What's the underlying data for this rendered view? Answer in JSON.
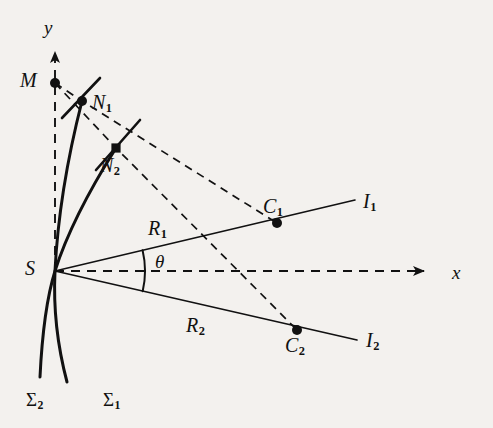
{
  "figure": {
    "kind": "geometric-diagram",
    "background_color": "#f3f1ee",
    "ink_color": "#111111",
    "axes": {
      "x_label": "x",
      "y_label": "y",
      "x_style": "dashed-with-arrow",
      "y_style": "dashed-with-arrow",
      "origin_label": "S"
    },
    "points": [
      {
        "id": "S",
        "label": "S",
        "x": 55,
        "y": 271,
        "marker": "vertex"
      },
      {
        "id": "M",
        "label": "M",
        "x": 55,
        "y": 83,
        "marker": "dot"
      },
      {
        "id": "N1",
        "label": "N",
        "sub": "1",
        "x": 82,
        "y": 101,
        "marker": "dot"
      },
      {
        "id": "N2",
        "label": "N",
        "sub": "2",
        "x": 116,
        "y": 148,
        "marker": "square"
      },
      {
        "id": "C1",
        "label": "C",
        "sub": "1",
        "x": 277,
        "y": 223,
        "marker": "dot"
      },
      {
        "id": "C2",
        "label": "C",
        "sub": "2",
        "x": 297,
        "y": 330,
        "marker": "dot"
      }
    ],
    "labels": [
      {
        "id": "label-y",
        "text": "y",
        "sub": "",
        "x": 44,
        "y": 18
      },
      {
        "id": "label-x",
        "text": "x",
        "sub": "",
        "x": 452,
        "y": 263
      },
      {
        "id": "label-M",
        "text": "M",
        "sub": "",
        "x": 20,
        "y": 70
      },
      {
        "id": "label-N1",
        "text": "N",
        "sub": "1",
        "x": 92,
        "y": 92
      },
      {
        "id": "label-N2",
        "text": "N",
        "sub": "2",
        "x": 100,
        "y": 155
      },
      {
        "id": "label-C1",
        "text": "C",
        "sub": "1",
        "x": 263,
        "y": 196
      },
      {
        "id": "label-C2",
        "text": "C",
        "sub": "2",
        "x": 285,
        "y": 335
      },
      {
        "id": "label-I1",
        "text": "I",
        "sub": "1",
        "x": 363,
        "y": 191
      },
      {
        "id": "label-I2",
        "text": "I",
        "sub": "2",
        "x": 366,
        "y": 330
      },
      {
        "id": "label-R1",
        "text": "R",
        "sub": "1",
        "x": 148,
        "y": 218
      },
      {
        "id": "label-R2",
        "text": "R",
        "sub": "2",
        "x": 186,
        "y": 315
      },
      {
        "id": "label-theta",
        "text": "θ",
        "sub": "",
        "x": 155,
        "y": 252
      },
      {
        "id": "label-Sigma1",
        "text": "Σ",
        "sub": "1",
        "x": 103,
        "y": 390
      },
      {
        "id": "label-Sigma2",
        "text": "Σ",
        "sub": "2",
        "x": 26,
        "y": 390
      },
      {
        "id": "label-S",
        "text": "S",
        "sub": "",
        "x": 25,
        "y": 258
      }
    ],
    "curves": [
      {
        "id": "Sigma1",
        "name": "wavefront-sigma-1",
        "label": "Σ",
        "sub": "1",
        "path": "M 116 148 C 92 186, 68 230, 55 271 C 46 300, 42 336, 40 377",
        "style": "solid"
      },
      {
        "id": "Sigma2",
        "name": "wavefront-sigma-2",
        "label": "Σ",
        "sub": "2",
        "path": "M 82 101 C 70 148, 58 210, 55 271 C 53 312, 58 348, 67 382",
        "style": "solid"
      }
    ],
    "rays": [
      {
        "id": "R1",
        "name": "ray-R1",
        "label": "R",
        "sub": "1",
        "from": [
          55,
          271
        ],
        "to": [
          355,
          200
        ],
        "style": "solid"
      },
      {
        "id": "R2",
        "name": "ray-R2",
        "label": "R",
        "sub": "2",
        "from": [
          55,
          271
        ],
        "to": [
          357,
          340
        ],
        "style": "solid"
      }
    ],
    "dashed_paths": [
      {
        "id": "path-M-N1-C1",
        "name": "dashed-ray-through-N1",
        "points": [
          [
            55,
            83
          ],
          [
            82,
            101
          ],
          [
            277,
            223
          ]
        ]
      },
      {
        "id": "path-M-N2-C2",
        "name": "dashed-ray-through-N2",
        "points": [
          [
            55,
            83
          ],
          [
            116,
            148
          ],
          [
            297,
            330
          ]
        ]
      },
      {
        "id": "path-y-axis",
        "name": "dashed-y-axis",
        "points": [
          [
            55,
            271
          ],
          [
            55,
            52
          ]
        ]
      },
      {
        "id": "path-x-axis",
        "name": "dashed-x-axis",
        "points": [
          [
            55,
            271
          ],
          [
            424,
            271
          ]
        ]
      }
    ],
    "tangents": [
      {
        "id": "tangent-N1",
        "name": "tangent-segment-at-N1",
        "from": [
          62,
          118
        ],
        "to": [
          100,
          78
        ]
      },
      {
        "id": "tangent-N2",
        "name": "tangent-segment-at-N2",
        "from": [
          96,
          170
        ],
        "to": [
          140,
          120
        ]
      }
    ],
    "angle_arc": {
      "id": "theta-arc",
      "name": "angle-theta-arc",
      "label": "θ",
      "center": [
        55,
        271
      ],
      "radius": 90,
      "from_deg": 13.3,
      "to_deg": -13.0
    },
    "caption": ""
  }
}
